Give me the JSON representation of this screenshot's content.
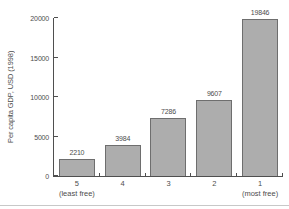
{
  "chart_data": {
    "type": "bar",
    "title": "",
    "xlabel": "",
    "ylabel": "Per capita GDP, USD (1998)",
    "categories": [
      "5",
      "4",
      "3",
      "2",
      "1"
    ],
    "category_sublabels": [
      "(least free)",
      "",
      "",
      "",
      "(most free)"
    ],
    "values": [
      2210,
      3984,
      7286,
      9607,
      19846
    ],
    "value_labels": [
      "2210",
      "3984",
      "7286",
      "9607",
      "19846"
    ],
    "ylim": [
      0,
      20000
    ],
    "yticks": [
      0,
      5000,
      10000,
      15000,
      20000
    ],
    "ytick_labels": [
      "0",
      "5000",
      "10 000",
      "15 000",
      "20 000"
    ],
    "grid": false,
    "legend": "none",
    "bar_fill_color": "#adadad",
    "bar_border_color": "#6e6e6e",
    "axis_color": "#4f4f4f",
    "text_color": "#4d4d4d"
  }
}
